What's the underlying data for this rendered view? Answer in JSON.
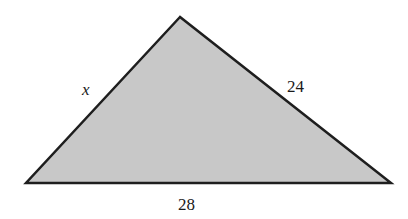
{
  "diagram": {
    "type": "triangle",
    "fill_color": "#c8c8c8",
    "stroke_color": "#1e1e1e",
    "vertices": {
      "apex": [
        180,
        17
      ],
      "bottom_left": [
        26,
        183
      ],
      "bottom_right": [
        391,
        183
      ]
    },
    "labels": {
      "left_side": "x",
      "right_side": "24",
      "base": "28"
    }
  }
}
